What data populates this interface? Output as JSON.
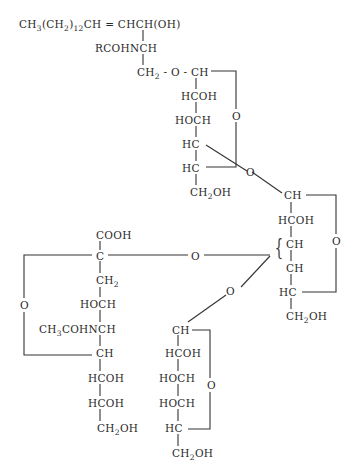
{
  "diagram": {
    "type": "chemical-structure",
    "ceramide": {
      "chain": {
        "pre": "CH",
        "s1": "3",
        "mid1": "(CH",
        "s2": "2",
        "mid2": ")",
        "s3": "12",
        "post": "CH = CHCH(OH)"
      },
      "amide": "RCOHNCH",
      "link": {
        "pre": "CH",
        "s": "2",
        "post": " - O - CH"
      }
    },
    "sugar1": {
      "c2": "HCOH",
      "c3": "HOCH",
      "c4": "HC",
      "c5": "HC",
      "c6": {
        "pre": "CH",
        "s": "2",
        "post": "OH"
      },
      "ring_o": "O"
    },
    "link_o1": "O",
    "sugar2": {
      "c1": "CH",
      "c2": "HCOH",
      "c3": "CH",
      "c4": "CH",
      "c5": "HC",
      "c6": {
        "pre": "CH",
        "s": "2",
        "post": "OH"
      },
      "ring_o": "O"
    },
    "sialic": {
      "cooh": "COOH",
      "c2": "C",
      "c3": {
        "pre": "CH",
        "s": "2"
      },
      "c4": "HOCH",
      "c5": {
        "pre": "CH",
        "s": "3",
        "post": "COHNCH"
      },
      "c6": "CH",
      "c7": "HCOH",
      "c8": "HCOH",
      "c9": {
        "pre": "CH",
        "s": "2",
        "post": "OH"
      },
      "ring_o": "O",
      "link_o": "O"
    },
    "link_o2": "O",
    "sugar3": {
      "c1": "CH",
      "c2": "HCOH",
      "c3": "HOCH",
      "c4": "HOCH",
      "c5": "HC",
      "c6": {
        "pre": "CH",
        "s": "2",
        "post": "OH"
      },
      "ring_o": "O"
    },
    "brace": "{"
  }
}
